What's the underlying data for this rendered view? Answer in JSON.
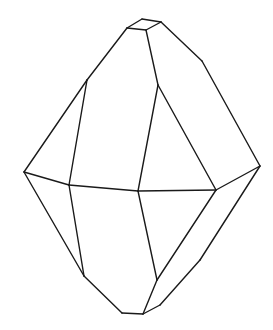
{
  "diagram": {
    "type": "crystal-line-drawing",
    "stroke_color": "#1a1a1a",
    "background": "#ffffff",
    "vertices": {
      "t1": [
        142,
        19
      ],
      "t2": [
        161,
        22
      ],
      "t3": [
        146,
        30
      ],
      "t4": [
        127,
        28
      ],
      "ul": [
        87,
        80
      ],
      "um": [
        158,
        85
      ],
      "ur": [
        202,
        61
      ],
      "lc": [
        24,
        172
      ],
      "ml": [
        69,
        185
      ],
      "mm": [
        138,
        191
      ],
      "mr": [
        216,
        190
      ],
      "rc": [
        260,
        166
      ],
      "ll": [
        84,
        276
      ],
      "lm": [
        157,
        280
      ],
      "lr": [
        200,
        260
      ],
      "lb": [
        160,
        305
      ],
      "b1": [
        122,
        313
      ],
      "b2": [
        143,
        314
      ]
    },
    "edges": [
      [
        "t1",
        "t2"
      ],
      [
        "t2",
        "t3"
      ],
      [
        "t3",
        "t4"
      ],
      [
        "t4",
        "t1"
      ],
      [
        "t4",
        "ul"
      ],
      [
        "ul",
        "lc"
      ],
      [
        "ul",
        "ml"
      ],
      [
        "t3",
        "um"
      ],
      [
        "um",
        "mm"
      ],
      [
        "um",
        "mr"
      ],
      [
        "t2",
        "ur"
      ],
      [
        "ur",
        "rc"
      ],
      [
        "lc",
        "ml"
      ],
      [
        "ml",
        "mm"
      ],
      [
        "mm",
        "mr"
      ],
      [
        "mr",
        "rc"
      ],
      [
        "lc",
        "ll"
      ],
      [
        "ml",
        "ll"
      ],
      [
        "mm",
        "lm"
      ],
      [
        "mr",
        "lm"
      ],
      [
        "rc",
        "lr"
      ],
      [
        "lr",
        "lb"
      ],
      [
        "lb",
        "b2"
      ],
      [
        "ll",
        "b1"
      ],
      [
        "b1",
        "b2"
      ],
      [
        "lm",
        "b2"
      ]
    ]
  }
}
